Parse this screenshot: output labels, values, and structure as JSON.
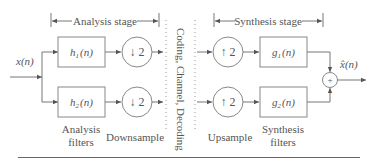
{
  "diagram": {
    "stages": {
      "analysis": "Analysis stage",
      "synthesis": "Synthesis stage"
    },
    "input": {
      "symbol": "x",
      "arg": "(n)"
    },
    "output": {
      "symbol": "x̂",
      "arg": "(n)"
    },
    "analysis_filters": [
      {
        "symbol": "h",
        "sub": "1",
        "arg": "(n)"
      },
      {
        "symbol": "h",
        "sub": "2",
        "arg": "(n)"
      }
    ],
    "downsample": [
      {
        "label": "↓ 2"
      },
      {
        "label": "↓ 2"
      }
    ],
    "upsample": [
      {
        "label": "↑ 2"
      },
      {
        "label": "↑ 2"
      }
    ],
    "synthesis_filters": [
      {
        "symbol": "g",
        "sub": "1",
        "arg": "(n)"
      },
      {
        "symbol": "g",
        "sub": "2",
        "arg": "(n)"
      }
    ],
    "channel_label": "Coding, Channel, Decoding",
    "sum_symbol": "+",
    "captions": {
      "analysis_filters_line1": "Analysis",
      "analysis_filters_line2": "filters",
      "downsample": "Downsample",
      "upsample": "Upsample",
      "synthesis_filters_line1": "Synthesis",
      "synthesis_filters_line2": "filters"
    }
  }
}
